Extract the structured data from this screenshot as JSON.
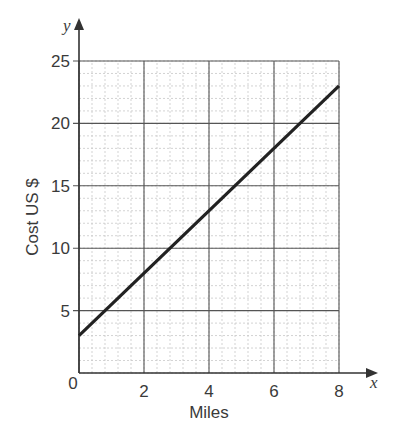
{
  "chart_data": {
    "type": "line",
    "title": "",
    "xlabel": "Miles",
    "ylabel": "Cost US $",
    "x_axis_var": "x",
    "y_axis_var": "y",
    "xlim": [
      0,
      8
    ],
    "ylim": [
      0,
      25
    ],
    "x_ticks": [
      "0",
      "2",
      "4",
      "6",
      "8"
    ],
    "y_ticks": [
      "5",
      "10",
      "15",
      "20",
      "25"
    ],
    "grid": {
      "major": true,
      "minor": true,
      "x_minor_step": 0.4,
      "y_minor_step": 1
    },
    "series": [
      {
        "name": "Cost",
        "x": [
          0,
          8
        ],
        "y": [
          3,
          23
        ],
        "color": "#222222"
      }
    ],
    "legend": null
  }
}
